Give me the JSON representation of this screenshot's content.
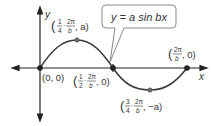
{
  "diagram": {
    "equation": "y = a sin bx",
    "axes": {
      "x_label": "x",
      "y_label": "y"
    },
    "points": [
      {
        "name": "origin",
        "label": "(0, 0)"
      },
      {
        "name": "maximum",
        "label_prefix": "(",
        "frac_num": "1",
        "frac_den": "4",
        "mid": "·",
        "period_num": "2π",
        "period_den": "b",
        "suffix": ", a)"
      },
      {
        "name": "zero-mid",
        "label_prefix": "(",
        "frac_num": "1",
        "frac_den": "2",
        "mid": "·",
        "period_num": "2π",
        "period_den": "b",
        "suffix": ", 0)"
      },
      {
        "name": "minimum",
        "label_prefix": "(",
        "frac_num": "3",
        "frac_den": "4",
        "mid": "·",
        "period_num": "2π",
        "period_den": "b",
        "suffix": ", −a)"
      },
      {
        "name": "period-end",
        "label_prefix": "(",
        "period_num": "2π",
        "period_den": "b",
        "suffix": ", 0)"
      }
    ],
    "colors": {
      "curve": "#3a3a3a",
      "axis": "#222222",
      "point": "#222222",
      "callout_border": "#8a8a8a",
      "callout_fill": "#ffffff",
      "text": "#333333"
    }
  }
}
